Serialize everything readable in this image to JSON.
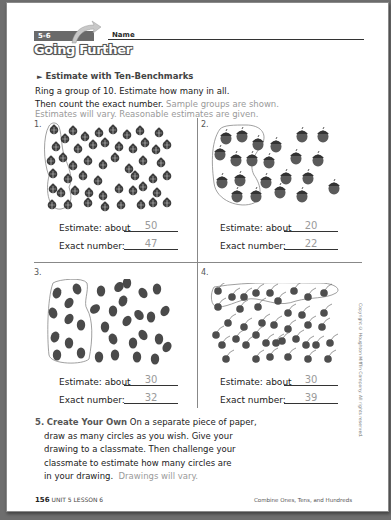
{
  "header": {
    "lesson_tag": "5-6",
    "banner": "Going Further",
    "name_label": "Name"
  },
  "section": {
    "title": "Estimate with Ten-Benchmarks"
  },
  "instructions": {
    "line1": "Ring a group of 10. Estimate how many in all.",
    "line2": "Then count the exact number.",
    "line2_note": "Sample groups are shown.",
    "line3_note": "Estimates will vary. Reasonable estimates are given."
  },
  "problems": [
    {
      "number": "1.",
      "object": "ladybug-icon",
      "estimate_label": "Estimate: about",
      "estimate": "50",
      "exact_label": "Exact number:",
      "exact": "47"
    },
    {
      "number": "2.",
      "object": "acorn-icon",
      "estimate_label": "Estimate: about",
      "estimate": "20",
      "exact_label": "Exact number:",
      "exact": "22"
    },
    {
      "number": "3.",
      "object": "leaf-icon",
      "estimate_label": "Estimate: about",
      "estimate": "30",
      "exact_label": "Exact number:",
      "exact": "32"
    },
    {
      "number": "4.",
      "object": "cherry-icon",
      "estimate_label": "Estimate: about",
      "estimate": "30",
      "exact_label": "Exact number:",
      "exact": "39"
    }
  ],
  "question5": {
    "number": "5.",
    "heading": "Create Your Own",
    "line1": "On a separate piece of paper,",
    "line2": "draw as many circles as you wish. Give your",
    "line3": "drawing to a classmate. Then challenge your",
    "line4": "classmate to estimate how many circles are",
    "line5": "in your drawing.",
    "note": "Drawings will vary."
  },
  "footer": {
    "page_number": "156",
    "lesson": "UNIT 5 LESSON 6",
    "topic": "Combine Ones, Tens, and Hundreds"
  },
  "copyright": "Copyright © Houghton Mifflin Company. All rights reserved.",
  "colors": {
    "ink": "#2a2a2a",
    "answer_gray": "#9a9a9a",
    "banner_gray": "#6a6a6a"
  }
}
